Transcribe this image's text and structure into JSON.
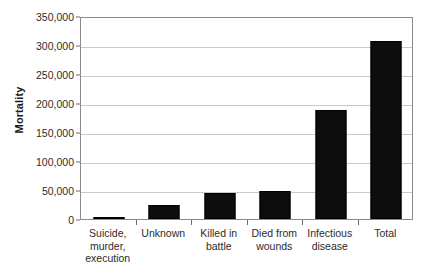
{
  "chart_data": {
    "type": "bar",
    "title": "",
    "subtitle": "",
    "xlabel": "",
    "ylabel": "Mortality",
    "categories": [
      "Suicide,\nmurder,\nexecution",
      "Unknown",
      "Killed in\nbattle",
      "Died from\nwounds",
      "Infectious\ndisease",
      "Total"
    ],
    "values": [
      3000,
      24000,
      45000,
      49000,
      188000,
      307000
    ],
    "ylim": [
      0,
      350000
    ],
    "y_ticks": [
      0,
      50000,
      100000,
      150000,
      200000,
      250000,
      300000,
      350000
    ],
    "y_tick_labels": [
      "0",
      "50,000",
      "100,000",
      "150,000",
      "200,000",
      "250,000",
      "300,000",
      "350,000"
    ],
    "grid": true,
    "grid_axis": "y",
    "legend": false,
    "legend_position": "none",
    "bar_color": "#0d0d0d",
    "grid_color": "#c9c9c9",
    "axis_color": "#8a8a8a",
    "background_color": "#ffffff",
    "annotations": []
  }
}
